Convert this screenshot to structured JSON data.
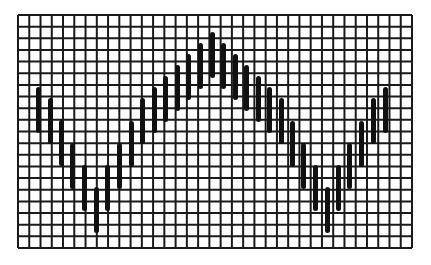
{
  "figure": {
    "background": "#ffffff",
    "line_color": "#1a1a1a",
    "bar_color": "#111111"
  },
  "grid": {
    "left": 18,
    "top": 15,
    "right": 412,
    "bottom": 248,
    "columns": 35,
    "rows": 20,
    "line_width": 2
  },
  "bars": {
    "width": 5,
    "length": 46,
    "items": [
      {
        "x": 38,
        "top": 87
      },
      {
        "x": 50,
        "top": 98
      },
      {
        "x": 61,
        "top": 120
      },
      {
        "x": 72,
        "top": 143
      },
      {
        "x": 84,
        "top": 165
      },
      {
        "x": 96,
        "top": 187
      },
      {
        "x": 107,
        "top": 165
      },
      {
        "x": 119,
        "top": 143
      },
      {
        "x": 131,
        "top": 121
      },
      {
        "x": 142,
        "top": 98
      },
      {
        "x": 154,
        "top": 87
      },
      {
        "x": 165,
        "top": 76
      },
      {
        "x": 177,
        "top": 65
      },
      {
        "x": 188,
        "top": 54
      },
      {
        "x": 200,
        "top": 43
      },
      {
        "x": 212,
        "top": 32
      },
      {
        "x": 223,
        "top": 43
      },
      {
        "x": 235,
        "top": 54
      },
      {
        "x": 246,
        "top": 65
      },
      {
        "x": 258,
        "top": 76
      },
      {
        "x": 269,
        "top": 87
      },
      {
        "x": 281,
        "top": 98
      },
      {
        "x": 292,
        "top": 121
      },
      {
        "x": 303,
        "top": 143
      },
      {
        "x": 315,
        "top": 165
      },
      {
        "x": 327,
        "top": 187
      },
      {
        "x": 338,
        "top": 165
      },
      {
        "x": 349,
        "top": 143
      },
      {
        "x": 361,
        "top": 121
      },
      {
        "x": 373,
        "top": 98
      },
      {
        "x": 385,
        "top": 87
      }
    ]
  }
}
